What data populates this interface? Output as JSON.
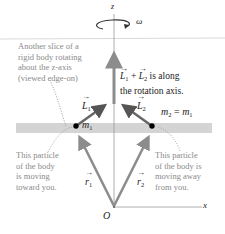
{
  "diagram": {
    "axes": {
      "z_label": "z",
      "x_label": "x",
      "origin_label": "O",
      "omega_label": "ω"
    },
    "annotations": {
      "slice": [
        "Another slice of a",
        "rigid body rotating",
        "about the z-axis",
        "(viewed edge-on)"
      ],
      "sum_note": [
        "+ is along",
        "the rotation axis."
      ],
      "particle_left": [
        "This particle",
        "of the body",
        "is moving",
        "toward you."
      ],
      "particle_right": [
        "This particle",
        "of the body is",
        "moving away",
        "from you."
      ]
    },
    "vectors": {
      "L1": "L",
      "L1_sub": "1",
      "L2": "L",
      "L2_sub": "2",
      "r1": "r",
      "r1_sub": "1",
      "r2": "r",
      "r2_sub": "2"
    },
    "masses": {
      "m1": "m",
      "m1_sub": "1",
      "m2_eq": "m",
      "m2_sub": "2",
      "equals": " = m",
      "eq_sub": "1"
    },
    "colors": {
      "vector_grey": "#8c8c8c",
      "slice_band": "#d4d4d4",
      "text_grey": "#8a8a8a"
    }
  }
}
